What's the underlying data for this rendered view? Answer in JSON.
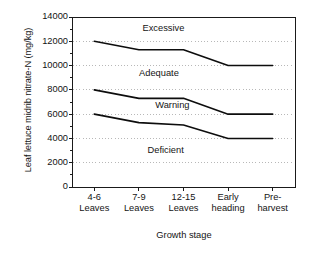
{
  "chart_data": {
    "type": "line",
    "title": "",
    "xlabel": "Growth stage",
    "ylabel": "Leaf lettuce midrib nitrate-N (mg/kg)",
    "categories": [
      "4-6 Leaves",
      "7-9 Leaves",
      "12-15 Leaves",
      "Early heading",
      "Pre-harvest"
    ],
    "category_lines": [
      {
        "l1": "4-6",
        "l2": "Leaves"
      },
      {
        "l1": "7-9",
        "l2": "Leaves"
      },
      {
        "l1": "12-15",
        "l2": "Leaves"
      },
      {
        "l1": "Early",
        "l2": "heading"
      },
      {
        "l1": "Pre-",
        "l2": "harvest"
      }
    ],
    "ylim": [
      0,
      14000
    ],
    "yticks": [
      14000,
      12000,
      10000,
      8000,
      6000,
      4000,
      2000,
      0
    ],
    "ytick_labels": [
      "14000",
      "12000",
      "10000",
      "8000",
      "6000",
      "4000",
      "2000",
      "0"
    ],
    "grid": "horizontal-dotted",
    "legend": "none",
    "series": [
      {
        "name": "Excessive/Adequate boundary",
        "values": [
          12000,
          11300,
          11300,
          10000,
          10000
        ]
      },
      {
        "name": "Adequate/Warning boundary",
        "values": [
          8000,
          7300,
          7300,
          6000,
          6000
        ]
      },
      {
        "name": "Warning/Deficient boundary",
        "values": [
          6000,
          5300,
          5100,
          4000,
          4000
        ]
      }
    ],
    "annotations": [
      {
        "text": "Excessive",
        "x_category_index": 1.55,
        "y": 13000
      },
      {
        "text": "Adequate",
        "x_category_index": 1.45,
        "y": 9300
      },
      {
        "text": "Warning",
        "x_category_index": 1.75,
        "y": 6650
      },
      {
        "text": "Deficient",
        "x_category_index": 1.6,
        "y": 3000
      }
    ]
  }
}
